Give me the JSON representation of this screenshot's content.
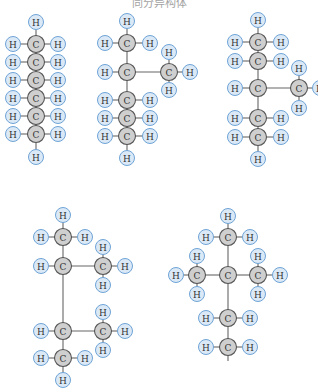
{
  "caption": "同分异构体",
  "style": {
    "h_fill": "#dbe9f7",
    "h_stroke": "#6ea3d6",
    "c_fill": "#cfcfcf",
    "c_stroke": "#555555",
    "bond": "#666666"
  },
  "molecules": [
    {
      "name": "hexane",
      "atoms": [
        {
          "id": "c1",
          "el": "C",
          "x": 36,
          "y": 44
        },
        {
          "id": "c2",
          "el": "C",
          "x": 36,
          "y": 62
        },
        {
          "id": "c3",
          "el": "C",
          "x": 36,
          "y": 80
        },
        {
          "id": "c4",
          "el": "C",
          "x": 36,
          "y": 98
        },
        {
          "id": "c5",
          "el": "C",
          "x": 36,
          "y": 116
        },
        {
          "id": "c6",
          "el": "C",
          "x": 36,
          "y": 134
        },
        {
          "id": "ht",
          "el": "H",
          "x": 36,
          "y": 22
        },
        {
          "id": "hb",
          "el": "H",
          "x": 36,
          "y": 157
        },
        {
          "id": "h1l",
          "el": "H",
          "x": 13,
          "y": 44
        },
        {
          "id": "h1r",
          "el": "H",
          "x": 58,
          "y": 44
        },
        {
          "id": "h2l",
          "el": "H",
          "x": 13,
          "y": 62
        },
        {
          "id": "h2r",
          "el": "H",
          "x": 58,
          "y": 62
        },
        {
          "id": "h3l",
          "el": "H",
          "x": 13,
          "y": 80
        },
        {
          "id": "h3r",
          "el": "H",
          "x": 58,
          "y": 80
        },
        {
          "id": "h4l",
          "el": "H",
          "x": 13,
          "y": 98
        },
        {
          "id": "h4r",
          "el": "H",
          "x": 58,
          "y": 98
        },
        {
          "id": "h5l",
          "el": "H",
          "x": 13,
          "y": 116
        },
        {
          "id": "h5r",
          "el": "H",
          "x": 58,
          "y": 116
        },
        {
          "id": "h6l",
          "el": "H",
          "x": 13,
          "y": 134
        },
        {
          "id": "h6r",
          "el": "H",
          "x": 58,
          "y": 134
        }
      ],
      "bonds": [
        [
          "ht",
          "c1"
        ],
        [
          "c1",
          "c2"
        ],
        [
          "c2",
          "c3"
        ],
        [
          "c3",
          "c4"
        ],
        [
          "c4",
          "c5"
        ],
        [
          "c5",
          "c6"
        ],
        [
          "c6",
          "hb"
        ],
        [
          "h1l",
          "c1"
        ],
        [
          "c1",
          "h1r"
        ],
        [
          "h2l",
          "c2"
        ],
        [
          "c2",
          "h2r"
        ],
        [
          "h3l",
          "c3"
        ],
        [
          "c3",
          "h3r"
        ],
        [
          "h4l",
          "c4"
        ],
        [
          "c4",
          "h4r"
        ],
        [
          "h5l",
          "c5"
        ],
        [
          "c5",
          "h5r"
        ],
        [
          "h6l",
          "c6"
        ],
        [
          "c6",
          "h6r"
        ]
      ]
    },
    {
      "name": "2-methylpentane",
      "atoms": [
        {
          "id": "c1",
          "el": "C",
          "x": 127,
          "y": 43
        },
        {
          "id": "c2",
          "el": "C",
          "x": 127,
          "y": 72
        },
        {
          "id": "c3",
          "el": "C",
          "x": 127,
          "y": 100
        },
        {
          "id": "c4",
          "el": "C",
          "x": 127,
          "y": 118
        },
        {
          "id": "c5",
          "el": "C",
          "x": 127,
          "y": 136
        },
        {
          "id": "cm",
          "el": "C",
          "x": 169,
          "y": 72
        },
        {
          "id": "ht",
          "el": "H",
          "x": 127,
          "y": 21
        },
        {
          "id": "hb",
          "el": "H",
          "x": 127,
          "y": 158
        },
        {
          "id": "h1l",
          "el": "H",
          "x": 105,
          "y": 43
        },
        {
          "id": "h1r",
          "el": "H",
          "x": 150,
          "y": 43
        },
        {
          "id": "h2l",
          "el": "H",
          "x": 105,
          "y": 72
        },
        {
          "id": "h3l",
          "el": "H",
          "x": 105,
          "y": 100
        },
        {
          "id": "h3r",
          "el": "H",
          "x": 150,
          "y": 100
        },
        {
          "id": "h4l",
          "el": "H",
          "x": 105,
          "y": 118
        },
        {
          "id": "h4r",
          "el": "H",
          "x": 150,
          "y": 118
        },
        {
          "id": "h5l",
          "el": "H",
          "x": 105,
          "y": 136
        },
        {
          "id": "h5r",
          "el": "H",
          "x": 150,
          "y": 136
        },
        {
          "id": "hmt",
          "el": "H",
          "x": 169,
          "y": 52
        },
        {
          "id": "hmb",
          "el": "H",
          "x": 169,
          "y": 90
        },
        {
          "id": "hmr",
          "el": "H",
          "x": 190,
          "y": 72
        }
      ],
      "bonds": [
        [
          "ht",
          "c1"
        ],
        [
          "c1",
          "c2"
        ],
        [
          "c2",
          "c3"
        ],
        [
          "c3",
          "c4"
        ],
        [
          "c4",
          "c5"
        ],
        [
          "c5",
          "hb"
        ],
        [
          "c2",
          "cm"
        ],
        [
          "h1l",
          "c1"
        ],
        [
          "c1",
          "h1r"
        ],
        [
          "h2l",
          "c2"
        ],
        [
          "h3l",
          "c3"
        ],
        [
          "c3",
          "h3r"
        ],
        [
          "h4l",
          "c4"
        ],
        [
          "c4",
          "h4r"
        ],
        [
          "h5l",
          "c5"
        ],
        [
          "c5",
          "h5r"
        ],
        [
          "hmt",
          "cm"
        ],
        [
          "cm",
          "hmb"
        ],
        [
          "cm",
          "hmr"
        ]
      ]
    },
    {
      "name": "3-methylpentane",
      "atoms": [
        {
          "id": "c1",
          "el": "C",
          "x": 258,
          "y": 42
        },
        {
          "id": "c2",
          "el": "C",
          "x": 258,
          "y": 61
        },
        {
          "id": "c3",
          "el": "C",
          "x": 258,
          "y": 88
        },
        {
          "id": "c4",
          "el": "C",
          "x": 258,
          "y": 118
        },
        {
          "id": "c5",
          "el": "C",
          "x": 258,
          "y": 137
        },
        {
          "id": "cm",
          "el": "C",
          "x": 299,
          "y": 88
        },
        {
          "id": "ht",
          "el": "H",
          "x": 258,
          "y": 20
        },
        {
          "id": "hb",
          "el": "H",
          "x": 258,
          "y": 159
        },
        {
          "id": "h1l",
          "el": "H",
          "x": 235,
          "y": 42
        },
        {
          "id": "h1r",
          "el": "H",
          "x": 281,
          "y": 42
        },
        {
          "id": "h2l",
          "el": "H",
          "x": 235,
          "y": 61
        },
        {
          "id": "h2r",
          "el": "H",
          "x": 281,
          "y": 61
        },
        {
          "id": "h3l",
          "el": "H",
          "x": 235,
          "y": 88
        },
        {
          "id": "h4l",
          "el": "H",
          "x": 235,
          "y": 118
        },
        {
          "id": "h4r",
          "el": "H",
          "x": 281,
          "y": 118
        },
        {
          "id": "h5l",
          "el": "H",
          "x": 235,
          "y": 137
        },
        {
          "id": "h5r",
          "el": "H",
          "x": 281,
          "y": 137
        },
        {
          "id": "hmt",
          "el": "H",
          "x": 299,
          "y": 68
        },
        {
          "id": "hmb",
          "el": "H",
          "x": 299,
          "y": 108
        },
        {
          "id": "hmr",
          "el": "H",
          "x": 320,
          "y": 88
        }
      ],
      "bonds": [
        [
          "ht",
          "c1"
        ],
        [
          "c1",
          "c2"
        ],
        [
          "c2",
          "c3"
        ],
        [
          "c3",
          "c4"
        ],
        [
          "c4",
          "c5"
        ],
        [
          "c5",
          "hb"
        ],
        [
          "c3",
          "cm"
        ],
        [
          "h1l",
          "c1"
        ],
        [
          "c1",
          "h1r"
        ],
        [
          "h2l",
          "c2"
        ],
        [
          "c2",
          "h2r"
        ],
        [
          "h3l",
          "c3"
        ],
        [
          "h4l",
          "c4"
        ],
        [
          "c4",
          "h4r"
        ],
        [
          "h5l",
          "c5"
        ],
        [
          "c5",
          "h5r"
        ],
        [
          "hmt",
          "cm"
        ],
        [
          "cm",
          "hmb"
        ],
        [
          "cm",
          "hmr"
        ]
      ]
    },
    {
      "name": "2,3-dimethylbutane",
      "atoms": [
        {
          "id": "c1",
          "el": "C",
          "x": 63,
          "y": 237
        },
        {
          "id": "c2",
          "el": "C",
          "x": 63,
          "y": 266
        },
        {
          "id": "c3",
          "el": "C",
          "x": 63,
          "y": 331
        },
        {
          "id": "c4",
          "el": "C",
          "x": 63,
          "y": 358
        },
        {
          "id": "cma",
          "el": "C",
          "x": 103,
          "y": 266
        },
        {
          "id": "cmb",
          "el": "C",
          "x": 103,
          "y": 331
        },
        {
          "id": "ht",
          "el": "H",
          "x": 63,
          "y": 215
        },
        {
          "id": "hb",
          "el": "H",
          "x": 63,
          "y": 380
        },
        {
          "id": "h1l",
          "el": "H",
          "x": 41,
          "y": 237
        },
        {
          "id": "h1r",
          "el": "H",
          "x": 85,
          "y": 237
        },
        {
          "id": "h2l",
          "el": "H",
          "x": 41,
          "y": 266
        },
        {
          "id": "h3l",
          "el": "H",
          "x": 41,
          "y": 331
        },
        {
          "id": "h4l",
          "el": "H",
          "x": 41,
          "y": 358
        },
        {
          "id": "h4r",
          "el": "H",
          "x": 85,
          "y": 358
        },
        {
          "id": "hat",
          "el": "H",
          "x": 103,
          "y": 247
        },
        {
          "id": "hab",
          "el": "H",
          "x": 103,
          "y": 285
        },
        {
          "id": "har",
          "el": "H",
          "x": 125,
          "y": 266
        },
        {
          "id": "hbt",
          "el": "H",
          "x": 103,
          "y": 312
        },
        {
          "id": "hbb",
          "el": "H",
          "x": 103,
          "y": 350
        },
        {
          "id": "hbr",
          "el": "H",
          "x": 125,
          "y": 331
        }
      ],
      "bonds": [
        [
          "ht",
          "c1"
        ],
        [
          "c1",
          "c2"
        ],
        [
          "c2",
          "c3"
        ],
        [
          "c3",
          "c4"
        ],
        [
          "c4",
          "hb"
        ],
        [
          "c2",
          "cma"
        ],
        [
          "c3",
          "cmb"
        ],
        [
          "h1l",
          "c1"
        ],
        [
          "c1",
          "h1r"
        ],
        [
          "h2l",
          "c2"
        ],
        [
          "h3l",
          "c3"
        ],
        [
          "h4l",
          "c4"
        ],
        [
          "c4",
          "h4r"
        ],
        [
          "hat",
          "cma"
        ],
        [
          "cma",
          "hab"
        ],
        [
          "cma",
          "har"
        ],
        [
          "hbt",
          "cmb"
        ],
        [
          "cmb",
          "hbb"
        ],
        [
          "cmb",
          "hbr"
        ]
      ]
    },
    {
      "name": "2,2-dimethylbutane",
      "atoms": [
        {
          "id": "c1",
          "el": "C",
          "x": 228,
          "y": 237
        },
        {
          "id": "c2",
          "el": "C",
          "x": 228,
          "y": 275
        },
        {
          "id": "c3",
          "el": "C",
          "x": 228,
          "y": 318
        },
        {
          "id": "c4",
          "el": "C",
          "x": 228,
          "y": 347
        },
        {
          "id": "cl",
          "el": "C",
          "x": 197,
          "y": 275
        },
        {
          "id": "cr",
          "el": "C",
          "x": 258,
          "y": 275
        },
        {
          "id": "ht",
          "el": "H",
          "x": 228,
          "y": 216
        },
        {
          "id": "h1l",
          "el": "H",
          "x": 206,
          "y": 237
        },
        {
          "id": "h1r",
          "el": "H",
          "x": 250,
          "y": 237
        },
        {
          "id": "hlt",
          "el": "H",
          "x": 197,
          "y": 256
        },
        {
          "id": "hlb",
          "el": "H",
          "x": 197,
          "y": 294
        },
        {
          "id": "hll",
          "el": "H",
          "x": 176,
          "y": 275
        },
        {
          "id": "hrt",
          "el": "H",
          "x": 258,
          "y": 256
        },
        {
          "id": "hrb",
          "el": "H",
          "x": 258,
          "y": 294
        },
        {
          "id": "hrr",
          "el": "H",
          "x": 280,
          "y": 275
        },
        {
          "id": "h3l",
          "el": "H",
          "x": 206,
          "y": 318
        },
        {
          "id": "h3r",
          "el": "H",
          "x": 250,
          "y": 318
        },
        {
          "id": "h4l",
          "el": "H",
          "x": 206,
          "y": 347
        },
        {
          "id": "h4r",
          "el": "H",
          "x": 250,
          "y": 347
        }
      ],
      "bonds": [
        [
          "ht",
          "c1"
        ],
        [
          "c1",
          "c2"
        ],
        [
          "c2",
          "c3"
        ],
        [
          "c3",
          "c4"
        ],
        [
          "c4",
          "c4b"
        ],
        [
          "cl",
          "c2"
        ],
        [
          "c2",
          "cr"
        ],
        [
          "h1l",
          "c1"
        ],
        [
          "c1",
          "h1r"
        ],
        [
          "hlt",
          "cl"
        ],
        [
          "cl",
          "hlb"
        ],
        [
          "hll",
          "cl"
        ],
        [
          "hrt",
          "cr"
        ],
        [
          "cr",
          "hrb"
        ],
        [
          "cr",
          "hrr"
        ],
        [
          "h3l",
          "c3"
        ],
        [
          "c3",
          "h3r"
        ],
        [
          "h4l",
          "c4"
        ],
        [
          "c4",
          "h4r"
        ]
      ]
    }
  ]
}
